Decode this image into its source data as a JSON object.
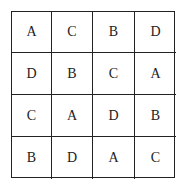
{
  "grid": {
    "rows": [
      [
        "A",
        "C",
        "B",
        "D"
      ],
      [
        "D",
        "B",
        "C",
        "A"
      ],
      [
        "C",
        "A",
        "D",
        "B"
      ],
      [
        "B",
        "D",
        "A",
        "C"
      ]
    ]
  }
}
